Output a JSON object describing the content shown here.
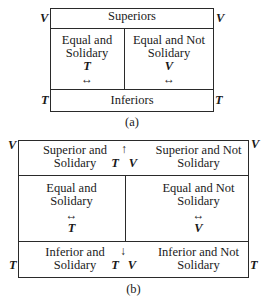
{
  "diagram_a": {
    "caption": "(a)",
    "top_label": "Superiors",
    "bottom_label": "Inferiors",
    "left_cell": {
      "line1": "Equal and",
      "line2": "Solidary",
      "symbol": "T",
      "arrow": "↔"
    },
    "right_cell": {
      "line1": "Equal and Not",
      "line2": "Solidary",
      "symbol": "V",
      "arrow": "↔"
    },
    "corner_labels": {
      "top_left": "V",
      "top_right": "V",
      "bottom_left": "T",
      "bottom_right": "T"
    }
  },
  "diagram_b": {
    "caption": "(b)",
    "top_left_cell": {
      "line1": "Superior and",
      "line2": "Solidary"
    },
    "top_right_cell": {
      "line1": "Superior and Not",
      "line2": "Solidary"
    },
    "top_center": {
      "arrow": "↑",
      "symbol_t": "T",
      "symbol_v": "V"
    },
    "middle_left_cell": {
      "line1": "Equal and",
      "line2": "Solidary",
      "arrow": "↔",
      "symbol": "T"
    },
    "middle_right_cell": {
      "line1": "Equal and Not",
      "line2": "Solidary",
      "arrow": "↔",
      "symbol": "V"
    },
    "bottom_left_cell": {
      "line1": "Inferior and",
      "line2": "Solidary"
    },
    "bottom_right_cell": {
      "line1": "Inferior and Not",
      "line2": "Solidary"
    },
    "bottom_center": {
      "arrow": "↓",
      "symbol_t": "T",
      "symbol_v": "V"
    },
    "corner_labels": {
      "top_left": "V",
      "top_right": "V",
      "bottom_left": "T",
      "bottom_right": "T"
    }
  }
}
